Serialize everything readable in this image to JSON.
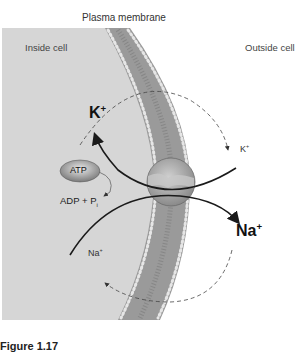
{
  "title": "Plasma membrane",
  "regions": {
    "inside": "Inside cell",
    "outside": "Outside cell"
  },
  "ions": {
    "k_big": "K",
    "k_big_charge": "+",
    "k_small": "K",
    "k_small_charge": "+",
    "na_big": "Na",
    "na_big_charge": "+",
    "na_small": "Na",
    "na_small_charge": "+"
  },
  "atp": {
    "label": "ATP",
    "products": "ADP + P",
    "products_sub": "i"
  },
  "caption": "Figure 1.17",
  "colors": {
    "cytoplasm": "#d6d6d6",
    "membrane": "#9a9a9a",
    "pump": "#b8b8b8",
    "arrow": "#1a1a1a"
  }
}
